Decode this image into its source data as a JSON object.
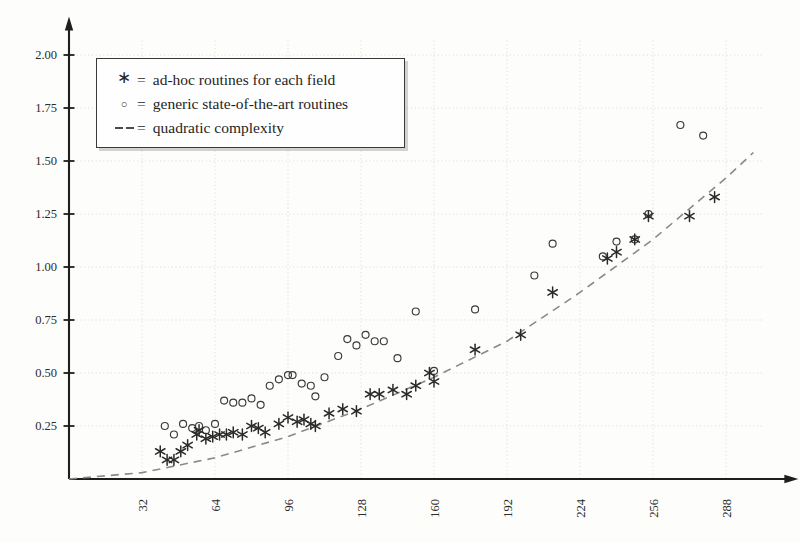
{
  "chart_data": {
    "type": "scatter",
    "title": "",
    "xlabel": "",
    "ylabel": "",
    "xlim": [
      0,
      300
    ],
    "ylim": [
      0,
      2.05
    ],
    "xticks": [
      32,
      64,
      96,
      128,
      160,
      192,
      224,
      256,
      288
    ],
    "yticks": [
      0.25,
      0.5,
      0.75,
      1.0,
      1.25,
      1.5,
      1.75,
      2.0
    ],
    "ytick_labels": [
      "0.25",
      "0.50",
      "0.75",
      "1.00",
      "1.25",
      "1.50",
      "1.75",
      "2.00"
    ],
    "xtick_labels": [
      "32",
      "64",
      "96",
      "128",
      "160",
      "192",
      "224",
      "256",
      "288"
    ],
    "xtick_rotation": 90,
    "grid": true,
    "legend_position": "upper-left-inside",
    "series": [
      {
        "name": "ad-hoc routines for each field",
        "marker": "asterisk",
        "color": "#2a2a2a",
        "points": [
          [
            40,
            0.13
          ],
          [
            43,
            0.09
          ],
          [
            46,
            0.09
          ],
          [
            49,
            0.13
          ],
          [
            52,
            0.16
          ],
          [
            56,
            0.21
          ],
          [
            57,
            0.23
          ],
          [
            60,
            0.19
          ],
          [
            63,
            0.2
          ],
          [
            66,
            0.21
          ],
          [
            69,
            0.21
          ],
          [
            72,
            0.22
          ],
          [
            76,
            0.21
          ],
          [
            80,
            0.25
          ],
          [
            83,
            0.24
          ],
          [
            86,
            0.22
          ],
          [
            92,
            0.26
          ],
          [
            96,
            0.29
          ],
          [
            100,
            0.27
          ],
          [
            103,
            0.28
          ],
          [
            106,
            0.26
          ],
          [
            108,
            0.25
          ],
          [
            114,
            0.31
          ],
          [
            120,
            0.33
          ],
          [
            126,
            0.32
          ],
          [
            132,
            0.4
          ],
          [
            136,
            0.4
          ],
          [
            142,
            0.42
          ],
          [
            148,
            0.4
          ],
          [
            152,
            0.44
          ],
          [
            158,
            0.5
          ],
          [
            160,
            0.46
          ],
          [
            178,
            0.61
          ],
          [
            198,
            0.68
          ],
          [
            212,
            0.88
          ],
          [
            236,
            1.04
          ],
          [
            240,
            1.07
          ],
          [
            248,
            1.13
          ],
          [
            254,
            1.24
          ],
          [
            272,
            1.24
          ],
          [
            283,
            1.33
          ]
        ]
      },
      {
        "name": "generic state-of-the-art routines",
        "marker": "circle",
        "color": "#3a3a3a",
        "points": [
          [
            42,
            0.25
          ],
          [
            46,
            0.21
          ],
          [
            50,
            0.26
          ],
          [
            54,
            0.24
          ],
          [
            57,
            0.25
          ],
          [
            60,
            0.23
          ],
          [
            64,
            0.26
          ],
          [
            68,
            0.37
          ],
          [
            72,
            0.36
          ],
          [
            76,
            0.36
          ],
          [
            80,
            0.38
          ],
          [
            84,
            0.35
          ],
          [
            88,
            0.44
          ],
          [
            92,
            0.47
          ],
          [
            96,
            0.49
          ],
          [
            98,
            0.49
          ],
          [
            102,
            0.45
          ],
          [
            106,
            0.44
          ],
          [
            108,
            0.39
          ],
          [
            112,
            0.48
          ],
          [
            118,
            0.58
          ],
          [
            122,
            0.66
          ],
          [
            126,
            0.63
          ],
          [
            130,
            0.68
          ],
          [
            134,
            0.65
          ],
          [
            138,
            0.65
          ],
          [
            144,
            0.57
          ],
          [
            152,
            0.79
          ],
          [
            160,
            0.51
          ],
          [
            178,
            0.8
          ],
          [
            204,
            0.96
          ],
          [
            212,
            1.11
          ],
          [
            234,
            1.05
          ],
          [
            240,
            1.12
          ],
          [
            248,
            1.13
          ],
          [
            254,
            1.25
          ],
          [
            268,
            1.67
          ],
          [
            278,
            1.62
          ]
        ]
      }
    ],
    "reference_curve": {
      "name": "quadratic complexity",
      "style": "dashed",
      "color": "#8a8a8a",
      "formula_note": "quadratic",
      "points": [
        [
          0,
          0.0
        ],
        [
          32,
          0.03
        ],
        [
          64,
          0.1
        ],
        [
          96,
          0.2
        ],
        [
          128,
          0.33
        ],
        [
          160,
          0.48
        ],
        [
          192,
          0.65
        ],
        [
          224,
          0.88
        ],
        [
          256,
          1.13
        ],
        [
          288,
          1.42
        ],
        [
          300,
          1.54
        ]
      ]
    }
  },
  "legend": {
    "entries": [
      {
        "marker_glyph": "∗",
        "equals": "=",
        "label": "ad-hoc routines for each field",
        "marker_name": "asterisk-marker"
      },
      {
        "marker_glyph": "○",
        "equals": "=",
        "label": "generic state-of-the-art routines",
        "marker_name": "circle-marker"
      },
      {
        "marker_glyph": "--",
        "equals": "=",
        "label": "quadratic complexity",
        "marker_name": "dashed-line-marker"
      }
    ]
  }
}
